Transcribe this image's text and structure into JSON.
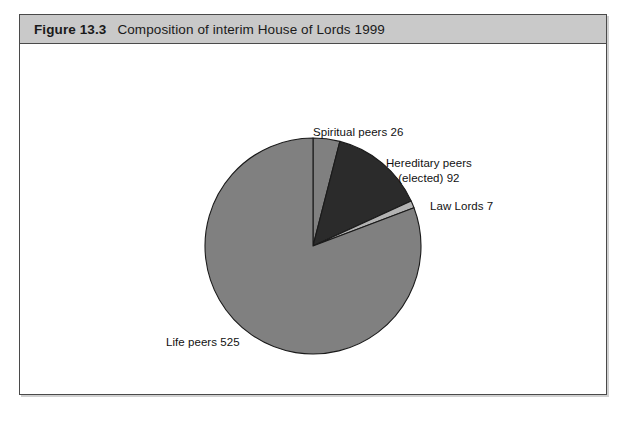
{
  "figure": {
    "number": "Figure 13.3",
    "title": "Composition of interim House of Lords 1999"
  },
  "labels": {
    "spiritual": "Spiritual peers 26",
    "hereditary_line1": "Hereditary peers",
    "hereditary_line2": "(elected) 92",
    "law_lords": "Law Lords 7",
    "life_peers": "Life peers 525"
  },
  "colors": {
    "header_band": "#c9c9c9",
    "frame_border": "#4a4a4a",
    "slice_spiritual": "#808080",
    "slice_hereditary": "#2b2b2b",
    "slice_law_lords": "#b3b3b3",
    "slice_life": "#808080",
    "slice_outline": "#1a1a1a",
    "background": "#ffffff"
  },
  "chart_data": {
    "type": "pie",
    "title": "Composition of interim House of Lords 1999",
    "categories": [
      "Spiritual peers",
      "Hereditary peers (elected)",
      "Law Lords",
      "Life peers"
    ],
    "values": [
      26,
      92,
      7,
      525
    ],
    "total": 650,
    "units": "members",
    "start_angle_deg": 0,
    "direction": "clockwise",
    "slice_angles_deg": [
      14.4,
      50.95,
      3.88,
      290.77
    ],
    "slice_percentages": [
      4.0,
      14.2,
      1.1,
      80.8
    ],
    "slice_colors": [
      "#808080",
      "#2b2b2b",
      "#b3b3b3",
      "#808080"
    ],
    "data_labels": [
      "Spiritual peers 26",
      "Hereditary peers (elected) 92",
      "Law Lords 7",
      "Life peers 525"
    ],
    "legend": "none",
    "grid": false,
    "xlabel": "",
    "ylabel": ""
  }
}
